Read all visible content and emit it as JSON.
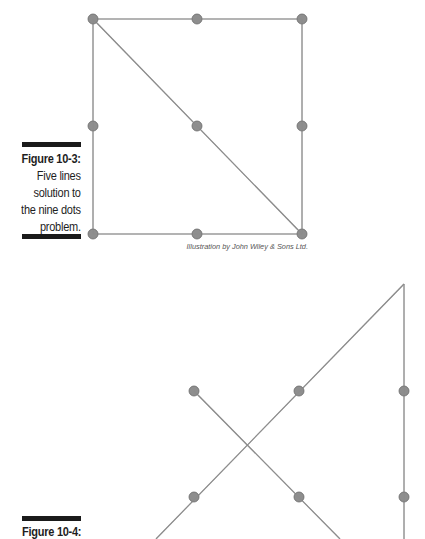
{
  "figure_10_3": {
    "number": "Figure 10-3:",
    "caption_lines": [
      "Five lines",
      "solution to",
      "the nine dots",
      "problem."
    ],
    "credit": "Illustration by John Wiley & Sons Ltd.",
    "dots": [
      [
        93,
        19
      ],
      [
        197,
        19
      ],
      [
        302,
        19
      ],
      [
        93,
        126
      ],
      [
        197,
        126
      ],
      [
        302,
        126
      ],
      [
        93,
        234
      ],
      [
        197,
        234
      ],
      [
        302,
        234
      ]
    ],
    "lines": [
      [
        93,
        19,
        302,
        19
      ],
      [
        302,
        19,
        302,
        234
      ],
      [
        302,
        234,
        93,
        234
      ],
      [
        93,
        234,
        93,
        19
      ],
      [
        93,
        19,
        302,
        234
      ]
    ]
  },
  "figure_10_4": {
    "number": "Figure 10-4:",
    "dots": [
      [
        194,
        391
      ],
      [
        299,
        391
      ],
      [
        404,
        391
      ],
      [
        194,
        497
      ],
      [
        299,
        497
      ],
      [
        404,
        497
      ]
    ],
    "lines": [
      [
        404,
        284,
        156,
        539
      ],
      [
        404,
        284,
        404,
        539
      ],
      [
        194,
        391,
        340,
        539
      ]
    ]
  },
  "colors": {
    "line": "#8c8c8c",
    "dot_fill": "#8e8e8e",
    "dot_stroke": "#6a6a6a",
    "bar": "#1a1a1a",
    "text": "#1e1e1e",
    "credit": "#555555"
  }
}
